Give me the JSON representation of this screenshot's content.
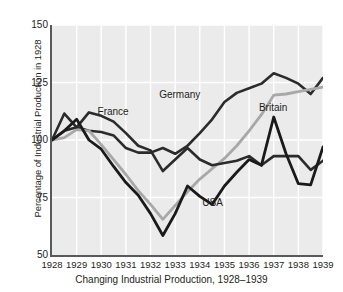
{
  "chart_data": {
    "type": "line",
    "title": "",
    "caption": "Changing Industrial Production, 1928–1939",
    "xlabel": "",
    "ylabel": "Percentage of Industrial Production in 1928",
    "x": [
      1928,
      1929,
      1930,
      1931,
      1932,
      1933,
      1934,
      1935,
      1936,
      1937,
      1938,
      1939
    ],
    "xtick_labels": [
      "1928",
      "1929",
      "1930",
      "1931",
      "1932",
      "1933",
      "1934",
      "1935",
      "1936",
      "1937",
      "1938",
      "1939"
    ],
    "ytick_labels": [
      "150",
      "125",
      "100",
      "75",
      "50"
    ],
    "ytick_values": [
      150,
      125,
      100,
      75,
      50
    ],
    "xlim": [
      1928,
      1939
    ],
    "ylim": [
      50,
      150
    ],
    "grid": true,
    "legend_position": "inline-labels",
    "series": [
      {
        "name": "Germany",
        "color": "#2b2b2b",
        "width": 2.6,
        "label_x": 1932.35,
        "label_y": 119.5,
        "x": [
          1928,
          1928.5,
          1929,
          1929.5,
          1930,
          1930.5,
          1931,
          1931.5,
          1932,
          1932.5,
          1933,
          1933.5,
          1934,
          1934.5,
          1935,
          1935.5,
          1936,
          1936.5,
          1937,
          1937.5,
          1938,
          1938.5,
          1939
        ],
        "values": [
          100,
          111.5,
          105.5,
          104,
          103.5,
          102,
          96.5,
          94.5,
          94.5,
          96.5,
          94,
          97.5,
          103,
          109,
          116.5,
          120.5,
          122.5,
          124.5,
          129,
          127,
          124.5,
          120,
          127
        ]
      },
      {
        "name": "Britain",
        "color": "#a8a8a8",
        "width": 2.8,
        "label_x": 1936.4,
        "label_y": 114,
        "x": [
          1928,
          1928.5,
          1929,
          1929.5,
          1930,
          1930.5,
          1931,
          1931.5,
          1932,
          1932.5,
          1933,
          1933.5,
          1934,
          1934.5,
          1935,
          1935.5,
          1936,
          1936.5,
          1937,
          1937.5,
          1938,
          1938.5,
          1939
        ],
        "values": [
          100,
          101,
          104.5,
          104,
          98,
          91.5,
          85,
          78,
          72,
          65.5,
          71.5,
          77.5,
          83,
          87.5,
          92,
          97.5,
          104,
          111,
          119.5,
          120,
          121,
          122,
          123
        ]
      },
      {
        "name": "France",
        "color": "#2b2b2b",
        "width": 2.6,
        "label_x": 1929.85,
        "label_y": 112,
        "x": [
          1928,
          1928.5,
          1929,
          1929.5,
          1930,
          1930.5,
          1931,
          1931.5,
          1932,
          1932.5,
          1933,
          1933.5,
          1934,
          1934.5,
          1935,
          1935.5,
          1936,
          1936.5,
          1937,
          1937.5,
          1938,
          1938.5,
          1939
        ],
        "values": [
          100,
          104,
          105.5,
          112,
          110.5,
          108,
          103,
          97.5,
          95.5,
          86.5,
          91.5,
          96.5,
          91.5,
          89,
          90,
          91,
          93,
          89,
          93,
          93,
          93,
          87,
          91
        ]
      },
      {
        "name": "USA",
        "color": "#1a1a1a",
        "width": 2.8,
        "label_x": 1934.1,
        "label_y": 72.5,
        "x": [
          1928,
          1928.5,
          1929,
          1929.5,
          1930,
          1930.5,
          1931,
          1931.5,
          1932,
          1932.5,
          1933,
          1933.5,
          1934,
          1934.5,
          1935,
          1935.5,
          1936,
          1936.5,
          1937,
          1937.5,
          1938,
          1938.5,
          1939
        ],
        "values": [
          100,
          104,
          109,
          100,
          96,
          88.5,
          81.5,
          76,
          68,
          58.5,
          68,
          80,
          75.5,
          72,
          80,
          86,
          91.5,
          89,
          110,
          94,
          81,
          80.5,
          97
        ]
      }
    ]
  },
  "annotations": {
    "germany_label": "Germany",
    "britain_label": "Britain",
    "france_label": "France",
    "usa_label": "USA"
  }
}
